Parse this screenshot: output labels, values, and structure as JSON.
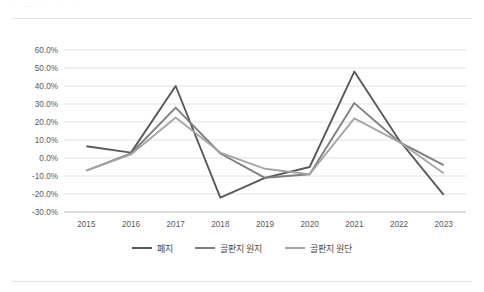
{
  "page": {
    "background_color": "#ffffff",
    "rule_color": "#e3e3e6",
    "ghost_text": "· — · ·· ·"
  },
  "chart_data": {
    "type": "line",
    "title": "",
    "subtitle": "",
    "xlabel": "",
    "ylabel": "",
    "categories": [
      "2015",
      "2016",
      "2017",
      "2018",
      "2019",
      "2020",
      "2021",
      "2022",
      "2023"
    ],
    "x": [
      2015,
      2016,
      2017,
      2018,
      2019,
      2020,
      2021,
      2022,
      2023
    ],
    "ylim": [
      -30,
      60
    ],
    "ytick_values": [
      60,
      50,
      40,
      30,
      20,
      10,
      0,
      -10,
      -20,
      -30
    ],
    "ytick_labels": [
      "60.0%",
      "50.0%",
      "40.0%",
      "30.0%",
      "20.0%",
      "10.0%",
      "0.0%",
      "-10.0%",
      "-20.0%",
      "-30.0%"
    ],
    "value_unit": "percent",
    "grid": {
      "horizontal": true,
      "vertical": false,
      "color": "#d9d9d9"
    },
    "legend": {
      "position": "bottom",
      "entries": [
        "폐지",
        "골판지 원지",
        "골판지 원단"
      ]
    },
    "series": [
      {
        "name": "폐지",
        "color": "#595959",
        "values": [
          6.5,
          3.0,
          40.0,
          -22.0,
          -11.0,
          -5.0,
          48.0,
          10.0,
          -20.5
        ]
      },
      {
        "name": "골판지 원지",
        "color": "#7f7f7f",
        "values": [
          -7.0,
          2.5,
          28.0,
          2.5,
          -11.0,
          -9.0,
          30.5,
          9.0,
          -4.0
        ]
      },
      {
        "name": "골판지 원단",
        "color": "#a6a6a6",
        "values": [
          -7.0,
          2.0,
          22.5,
          3.0,
          -6.0,
          -9.0,
          22.0,
          9.0,
          -8.5
        ]
      }
    ]
  }
}
